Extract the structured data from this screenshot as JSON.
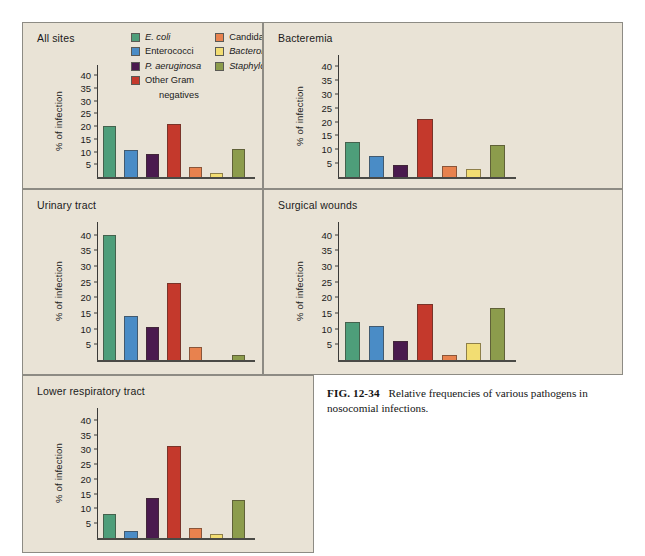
{
  "page": {
    "running_head": "",
    "background": "#ffffff"
  },
  "caption": {
    "fig_number": "FIG. 12-34",
    "text": "Relative frequencies of various pathogens in nosocomial infections."
  },
  "legend": {
    "column_left": [
      {
        "label": "E. coli",
        "italic": true,
        "color": "#4e9e7a"
      },
      {
        "label": "Enterococci",
        "italic": false,
        "color": "#4a8cc6"
      },
      {
        "label": "P. aeruginosa",
        "italic": true,
        "color": "#4a1a4e"
      },
      {
        "label": "Other Gram",
        "italic": false,
        "color": "#c4392c"
      }
    ],
    "continuation": "negatives",
    "column_right": [
      {
        "label": "Candida",
        "italic": false,
        "color": "#e8824e"
      },
      {
        "label": "Bacteroides",
        "italic": true,
        "color": "#f2dd72"
      },
      {
        "label": "Staphylococcus",
        "italic": true,
        "color": "#8c9c4c"
      }
    ]
  },
  "axis": {
    "ylabel": "% of infection",
    "ticks": [
      5,
      10,
      15,
      20,
      25,
      30,
      35,
      40
    ],
    "ymin": 0,
    "ymax": 44
  },
  "panels": {
    "allsites": {
      "title": "All sites"
    },
    "bacteremia": {
      "title": "Bacteremia"
    },
    "urinary": {
      "title": "Urinary tract"
    },
    "surgical": {
      "title": "Surgical wounds"
    },
    "lrt": {
      "title": "Lower respiratory tract"
    }
  },
  "chart_data": {
    "type": "bar",
    "title": "Relative frequencies of various pathogens in nosocomial infections",
    "xlabel": "",
    "ylabel": "% of infection",
    "ylim": [
      0,
      44
    ],
    "yticks": [
      5,
      10,
      15,
      20,
      25,
      30,
      35,
      40
    ],
    "grid": false,
    "legend_position": "top-center (inside All sites panel)",
    "categories": [
      "E. coli",
      "Enterococci",
      "P. aeruginosa",
      "Other Gram negatives",
      "Candida",
      "Bacteroides",
      "Staphylococcus"
    ],
    "category_colors": [
      "#4e9e7a",
      "#4a8cc6",
      "#4a1a4e",
      "#c4392c",
      "#e8824e",
      "#f2dd72",
      "#8c9c4c"
    ],
    "panels": [
      {
        "name": "All sites",
        "values": [
          20,
          10.5,
          9,
          21,
          4,
          1.5,
          11
        ]
      },
      {
        "name": "Bacteremia",
        "values": [
          12.5,
          7.5,
          4.5,
          21,
          4,
          3,
          11.5
        ]
      },
      {
        "name": "Urinary tract",
        "values": [
          40,
          14,
          10.5,
          24.5,
          4,
          0,
          1.5
        ]
      },
      {
        "name": "Surgical wounds",
        "values": [
          12,
          11,
          6,
          18,
          1.5,
          5.5,
          16.5
        ]
      },
      {
        "name": "Lower respiratory tract",
        "values": [
          8,
          2.5,
          13.5,
          31,
          3.5,
          1.5,
          13
        ]
      }
    ]
  }
}
